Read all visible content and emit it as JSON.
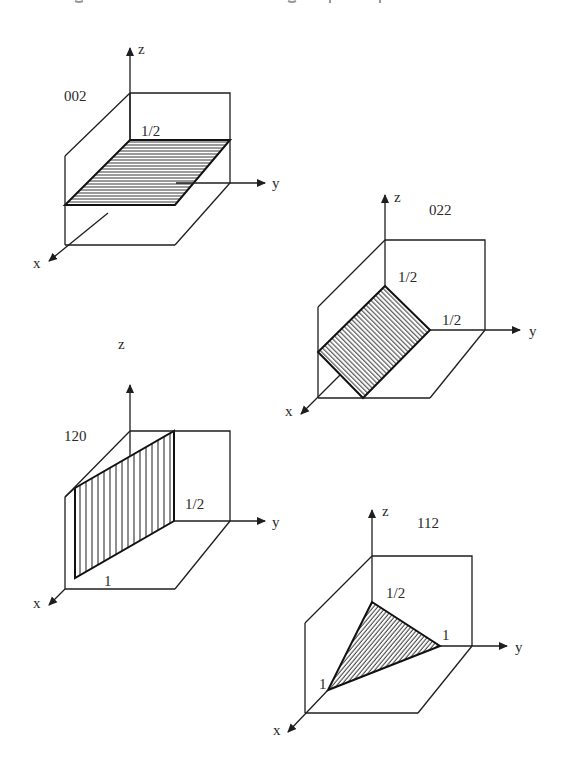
{
  "figure": {
    "colors": {
      "line": "#1e1e1e",
      "hatch": "#1e1e1e",
      "background": "#ffffff",
      "text": "#2a2a2a"
    },
    "panels": [
      {
        "id": "002",
        "index_label": "002",
        "axes": {
          "x": "x",
          "y": "y",
          "z": "z"
        },
        "intercept_labels": [
          "1/2"
        ],
        "hatch_direction": "horizontal"
      },
      {
        "id": "022",
        "index_label": "022",
        "axes": {
          "x": "x",
          "y": "y",
          "z": "z"
        },
        "intercept_labels": [
          "1/2",
          "1/2"
        ],
        "hatch_direction": "parallel-to-x"
      },
      {
        "id": "120",
        "index_label": "120",
        "axes": {
          "x": "x",
          "y": "y",
          "z": "z"
        },
        "intercept_labels": [
          "1",
          "1/2"
        ],
        "hatch_direction": "vertical"
      },
      {
        "id": "112",
        "index_label": "112",
        "axes": {
          "x": "x",
          "y": "y",
          "z": "z"
        },
        "intercept_labels": [
          "1/2",
          "1",
          "1"
        ],
        "hatch_direction": "diagonal"
      }
    ]
  }
}
